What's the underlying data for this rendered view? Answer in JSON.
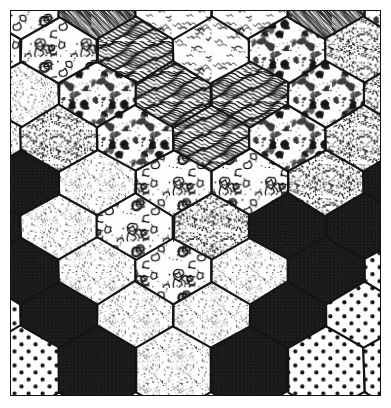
{
  "figure": {
    "medium": "pen-and-ink line art",
    "width": 391,
    "height": 408,
    "background_color": "#ffffff",
    "paper_color": "#fdfdfb",
    "ink_color": "#141414",
    "frame": {
      "visible": true,
      "stroke_color": "#111111",
      "stroke_width": 1.5,
      "margin": 10
    }
  },
  "grid": {
    "type": "hexagonal",
    "orientation": "pointy-top",
    "hex_width": 76,
    "hex_height": 88,
    "column_step": 76,
    "row_step": 66,
    "cell_stroke_width": 2.2,
    "columns": 6,
    "rows": 7
  },
  "textures": [
    {
      "id": "blob",
      "label": "Blob Clusters",
      "density": "heavy",
      "tone": 0.55
    },
    {
      "id": "diag-hatch",
      "label": "Diagonal Hatch",
      "density": "heavy",
      "tone": 0.6
    },
    {
      "id": "squiggle",
      "label": "Squiggle Worms",
      "density": "light",
      "tone": 0.28
    },
    {
      "id": "wave-grain",
      "label": "Wavy Wood Grain",
      "density": "heavy",
      "tone": 0.62
    },
    {
      "id": "stipple",
      "label": "Fine Stipple",
      "density": "light",
      "tone": 0.22
    },
    {
      "id": "coarse-stipple",
      "label": "Coarse Stipple",
      "density": "medium",
      "tone": 0.34
    },
    {
      "id": "crosshatch",
      "label": "Dense Crosshatch",
      "density": "heavy",
      "tone": 0.72
    },
    {
      "id": "polka",
      "label": "Polka Dots",
      "density": "medium",
      "tone": 0.4
    },
    {
      "id": "popcorn",
      "label": "Popcorn Clusters",
      "density": "medium",
      "tone": 0.45
    }
  ],
  "chart_data": {
    "type": "heatmap",
    "xlabel": "",
    "ylabel": "",
    "grid": true,
    "legend_position": "none",
    "categories": [
      "blob",
      "diag-hatch",
      "squiggle",
      "wave-grain",
      "stipple",
      "coarse-stipple",
      "crosshatch",
      "polka",
      "popcorn"
    ],
    "cells": [
      {
        "row": 0,
        "col": 0,
        "cx": 10,
        "cy": 6,
        "texture": "blob"
      },
      {
        "row": 0,
        "col": 1,
        "cx": 86,
        "cy": 6,
        "texture": "diag-hatch"
      },
      {
        "row": 0,
        "col": 2,
        "cx": 162,
        "cy": 6,
        "texture": "squiggle"
      },
      {
        "row": 0,
        "col": 3,
        "cx": 238,
        "cy": 6,
        "texture": "squiggle"
      },
      {
        "row": 0,
        "col": 4,
        "cx": 314,
        "cy": 6,
        "texture": "diag-hatch"
      },
      {
        "row": 0,
        "col": 5,
        "cx": 390,
        "cy": 6,
        "texture": "popcorn"
      },
      {
        "row": 1,
        "col": 0,
        "cx": -28,
        "cy": 50,
        "texture": "blob"
      },
      {
        "row": 1,
        "col": 1,
        "cx": 48,
        "cy": 50,
        "texture": "blob"
      },
      {
        "row": 1,
        "col": 2,
        "cx": 124,
        "cy": 50,
        "texture": "wave-grain"
      },
      {
        "row": 1,
        "col": 3,
        "cx": 200,
        "cy": 50,
        "texture": "squiggle"
      },
      {
        "row": 1,
        "col": 4,
        "cx": 276,
        "cy": 50,
        "texture": "popcorn"
      },
      {
        "row": 1,
        "col": 5,
        "cx": 352,
        "cy": 50,
        "texture": "coarse-stipple"
      },
      {
        "row": 2,
        "col": 0,
        "cx": 10,
        "cy": 94,
        "texture": "stipple"
      },
      {
        "row": 2,
        "col": 1,
        "cx": 86,
        "cy": 94,
        "texture": "popcorn"
      },
      {
        "row": 2,
        "col": 2,
        "cx": 162,
        "cy": 94,
        "texture": "wave-grain"
      },
      {
        "row": 2,
        "col": 3,
        "cx": 238,
        "cy": 94,
        "texture": "wave-grain"
      },
      {
        "row": 2,
        "col": 4,
        "cx": 314,
        "cy": 94,
        "texture": "popcorn"
      },
      {
        "row": 2,
        "col": 5,
        "cx": 390,
        "cy": 94,
        "texture": "coarse-stipple"
      },
      {
        "row": 3,
        "col": 0,
        "cx": -28,
        "cy": 138,
        "texture": "stipple"
      },
      {
        "row": 3,
        "col": 1,
        "cx": 48,
        "cy": 138,
        "texture": "coarse-stipple"
      },
      {
        "row": 3,
        "col": 2,
        "cx": 124,
        "cy": 138,
        "texture": "popcorn"
      },
      {
        "row": 3,
        "col": 3,
        "cx": 200,
        "cy": 138,
        "texture": "wave-grain"
      },
      {
        "row": 3,
        "col": 4,
        "cx": 276,
        "cy": 138,
        "texture": "popcorn"
      },
      {
        "row": 3,
        "col": 5,
        "cx": 352,
        "cy": 138,
        "texture": "coarse-stipple"
      },
      {
        "row": 4,
        "col": 0,
        "cx": 10,
        "cy": 182,
        "texture": "crosshatch"
      },
      {
        "row": 4,
        "col": 1,
        "cx": 86,
        "cy": 182,
        "texture": "stipple"
      },
      {
        "row": 4,
        "col": 2,
        "cx": 162,
        "cy": 182,
        "texture": "blob"
      },
      {
        "row": 4,
        "col": 3,
        "cx": 238,
        "cy": 182,
        "texture": "blob"
      },
      {
        "row": 4,
        "col": 4,
        "cx": 314,
        "cy": 182,
        "texture": "coarse-stipple"
      },
      {
        "row": 4,
        "col": 5,
        "cx": 390,
        "cy": 182,
        "texture": "crosshatch"
      },
      {
        "row": 5,
        "col": 0,
        "cx": -28,
        "cy": 226,
        "texture": "crosshatch"
      },
      {
        "row": 5,
        "col": 1,
        "cx": 48,
        "cy": 226,
        "texture": "stipple"
      },
      {
        "row": 5,
        "col": 2,
        "cx": 124,
        "cy": 226,
        "texture": "blob"
      },
      {
        "row": 5,
        "col": 3,
        "cx": 200,
        "cy": 226,
        "texture": "coarse-stipple"
      },
      {
        "row": 5,
        "col": 4,
        "cx": 276,
        "cy": 226,
        "texture": "crosshatch"
      },
      {
        "row": 5,
        "col": 5,
        "cx": 352,
        "cy": 226,
        "texture": "crosshatch"
      },
      {
        "row": 6,
        "col": 0,
        "cx": 10,
        "cy": 270,
        "texture": "crosshatch"
      },
      {
        "row": 6,
        "col": 1,
        "cx": 86,
        "cy": 270,
        "texture": "stipple"
      },
      {
        "row": 6,
        "col": 2,
        "cx": 162,
        "cy": 270,
        "texture": "blob"
      },
      {
        "row": 6,
        "col": 3,
        "cx": 238,
        "cy": 270,
        "texture": "stipple"
      },
      {
        "row": 6,
        "col": 4,
        "cx": 314,
        "cy": 270,
        "texture": "crosshatch"
      },
      {
        "row": 6,
        "col": 5,
        "cx": 390,
        "cy": 270,
        "texture": "polka"
      },
      {
        "row": 7,
        "col": 0,
        "cx": -28,
        "cy": 314,
        "texture": "polka"
      },
      {
        "row": 7,
        "col": 1,
        "cx": 48,
        "cy": 314,
        "texture": "crosshatch"
      },
      {
        "row": 7,
        "col": 2,
        "cx": 124,
        "cy": 314,
        "texture": "stipple"
      },
      {
        "row": 7,
        "col": 3,
        "cx": 200,
        "cy": 314,
        "texture": "stipple"
      },
      {
        "row": 7,
        "col": 4,
        "cx": 276,
        "cy": 314,
        "texture": "crosshatch"
      },
      {
        "row": 7,
        "col": 5,
        "cx": 352,
        "cy": 314,
        "texture": "polka"
      },
      {
        "row": 8,
        "col": 0,
        "cx": 10,
        "cy": 358,
        "texture": "polka"
      },
      {
        "row": 8,
        "col": 1,
        "cx": 86,
        "cy": 358,
        "texture": "crosshatch"
      },
      {
        "row": 8,
        "col": 2,
        "cx": 162,
        "cy": 358,
        "texture": "stipple"
      },
      {
        "row": 8,
        "col": 3,
        "cx": 238,
        "cy": 358,
        "texture": "crosshatch"
      },
      {
        "row": 8,
        "col": 4,
        "cx": 314,
        "cy": 358,
        "texture": "polka"
      },
      {
        "row": 8,
        "col": 5,
        "cx": 390,
        "cy": 358,
        "texture": "polka"
      }
    ]
  }
}
